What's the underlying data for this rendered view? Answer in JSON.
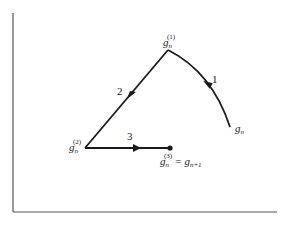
{
  "diagram": {
    "type": "iteration-path",
    "axes": {
      "x_axis": true,
      "y_axis": true,
      "tick_labels": []
    },
    "points": {
      "start": {
        "base": "g",
        "sub": "n",
        "sup": ""
      },
      "p1": {
        "base": "g",
        "sub": "n",
        "sup": "(1)"
      },
      "p2": {
        "base": "g",
        "sub": "n",
        "sup": "(2)"
      },
      "p3": {
        "base": "g",
        "sub": "n",
        "sup": "(3)",
        "equals": "=",
        "rhs_base": "g",
        "rhs_sub": "n+1"
      }
    },
    "steps": [
      {
        "label": "1",
        "from": "start",
        "to": "p1",
        "shape": "curve"
      },
      {
        "label": "2",
        "from": "p1",
        "to": "p2",
        "shape": "line"
      },
      {
        "label": "3",
        "from": "p2",
        "to": "p3",
        "shape": "line"
      }
    ],
    "colors": {
      "stroke": "#1a1a1a",
      "axis": "#555555",
      "background": "#ffffff"
    }
  }
}
